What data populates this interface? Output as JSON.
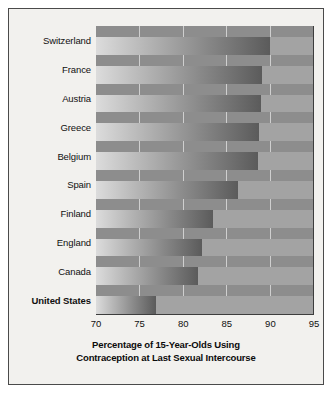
{
  "chart_data": {
    "type": "bar",
    "orientation": "horizontal",
    "title": "",
    "xlabel_line1": "Percentage of 15-Year-Olds Using",
    "xlabel_line2": "Contraception at Last Sexual Intercourse",
    "ylabel": "",
    "xlim": [
      70,
      95
    ],
    "xticks": [
      70,
      75,
      80,
      85,
      90,
      95
    ],
    "xtick_labels": [
      "70",
      "75",
      "80",
      "85",
      "90",
      "95"
    ],
    "grid": true,
    "legend": "none",
    "categories": [
      "Switzerland",
      "France",
      "Austria",
      "Greece",
      "Belgium",
      "Spain",
      "Finland",
      "England",
      "Canada",
      "United States"
    ],
    "values": [
      90.0,
      89.1,
      89.0,
      88.8,
      88.7,
      86.4,
      83.5,
      82.2,
      81.7,
      76.9
    ],
    "highlight_category": "United States",
    "series": [
      {
        "name": "Percentage of 15-Year-Olds Using Contraception at Last Sexual Intercourse",
        "values": [
          90.0,
          89.1,
          89.0,
          88.8,
          88.7,
          86.4,
          83.5,
          82.2,
          81.7,
          76.9
        ]
      }
    ]
  },
  "style": {
    "figure_background": "#f2f1ee",
    "plot_background": "#8d8d8d",
    "row_band": "#a3a3a3",
    "gridline_color": "#cfcfcf",
    "bar_gradient_light": "#dcdcdc",
    "bar_gradient_dark": "#5b5b5b",
    "border_color": "#4a4a4a",
    "text_color": "#101010"
  }
}
